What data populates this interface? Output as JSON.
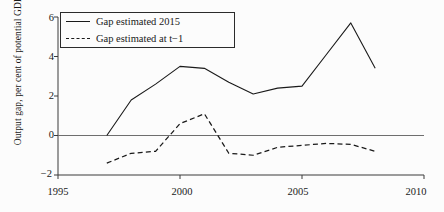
{
  "chart_data": {
    "type": "line",
    "title": "",
    "xlabel": "",
    "ylabel": "Output gap, per cent of potential GDP",
    "xlim": [
      1995,
      2010
    ],
    "ylim": [
      -2,
      6
    ],
    "xticks": [
      1995,
      2000,
      2005,
      2010
    ],
    "xtick_labels": [
      "1995",
      "2000",
      "2005",
      "2010"
    ],
    "yticks": [
      -2,
      0,
      2,
      4,
      6
    ],
    "ytick_labels": [
      "−2",
      "0",
      "2",
      "4",
      "6"
    ],
    "grid": false,
    "zero_line": true,
    "legend_position": "upper-left",
    "series": [
      {
        "name": "Gap estimated 2015",
        "style": "solid",
        "color": "#1a1a1a",
        "x": [
          1997,
          1998,
          1999,
          2000,
          2001,
          2002,
          2003,
          2004,
          2005,
          2006,
          2007,
          2008
        ],
        "values": [
          0.0,
          1.8,
          2.6,
          3.5,
          3.4,
          2.7,
          2.1,
          2.4,
          2.5,
          4.1,
          5.7,
          3.4
        ]
      },
      {
        "name": "Gap estimated at t−1",
        "style": "dashed",
        "color": "#1a1a1a",
        "x": [
          1997,
          1998,
          1999,
          2000,
          2001,
          2002,
          2003,
          2004,
          2005,
          2006,
          2007,
          2008
        ],
        "values": [
          -1.4,
          -0.9,
          -0.8,
          0.6,
          1.1,
          -0.9,
          -1.0,
          -0.6,
          -0.5,
          -0.4,
          -0.45,
          -0.8
        ]
      }
    ]
  },
  "legend": {
    "items": [
      {
        "label": "Gap estimated 2015"
      },
      {
        "label": "Gap estimated at t−1"
      }
    ]
  },
  "axis": {
    "y_label": "Output gap, per cent of potential GDP",
    "y_ticks": [
      "6",
      "4",
      "2",
      "0",
      "−2"
    ],
    "x_ticks": [
      "1995",
      "2000",
      "2005",
      "2010"
    ]
  }
}
